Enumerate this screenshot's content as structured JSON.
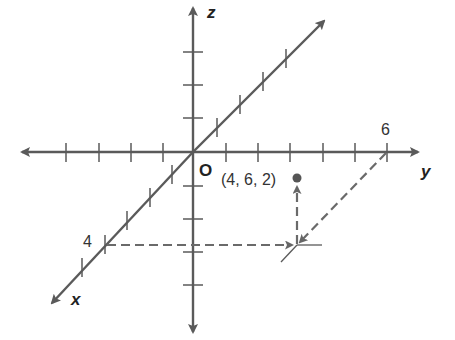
{
  "diagram": {
    "type": "3d-coordinate-system",
    "axes": {
      "x": {
        "label": "x",
        "tick_label": "4"
      },
      "y": {
        "label": "y",
        "tick_label": "6"
      },
      "z": {
        "label": "z"
      }
    },
    "origin_label": "O",
    "point": {
      "label": "(4, 6, 2)",
      "x": 4,
      "y": 6,
      "z": 2
    },
    "colors": {
      "axis": "#5a5a5a",
      "dashed": "#6a6a6a",
      "point": "#555555",
      "text": "#222222"
    }
  }
}
